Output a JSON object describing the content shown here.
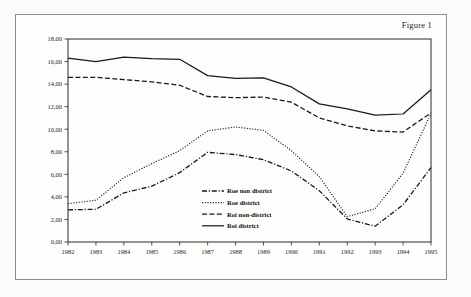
{
  "figure": {
    "caption": "Figure 1"
  },
  "chart_data": {
    "type": "line",
    "title": "Figure 1",
    "xlabel": "",
    "ylabel": "",
    "grid": false,
    "legend_position": "center",
    "xlim": [
      1982,
      1995
    ],
    "ylim": [
      0,
      18
    ],
    "ytick_step": 2,
    "x": [
      1982,
      1983,
      1984,
      1985,
      1986,
      1987,
      1988,
      1989,
      1990,
      1991,
      1992,
      1993,
      1994,
      1995
    ],
    "categories": [
      "1982",
      "1983",
      "1984",
      "1985",
      "1986",
      "1987",
      "1988",
      "1989",
      "1990",
      "1991",
      "1992",
      "1993",
      "1994",
      "1995"
    ],
    "ytick_labels": [
      "0,00",
      "2,00",
      "4,00",
      "6,00",
      "8,00",
      "10,00",
      "12,00",
      "14,00",
      "16,00",
      "18,00"
    ],
    "ytick_values": [
      0,
      2,
      4,
      6,
      8,
      10,
      12,
      14,
      16,
      18
    ],
    "series": [
      {
        "name": "Roe non district",
        "style": "dash-dot",
        "values": [
          2.85,
          2.9,
          4.35,
          4.95,
          6.15,
          7.95,
          7.75,
          7.3,
          6.3,
          4.55,
          2.05,
          1.4,
          3.3,
          6.6
        ]
      },
      {
        "name": "Roe district",
        "style": "dotted",
        "values": [
          3.4,
          3.7,
          5.7,
          6.95,
          8.1,
          9.85,
          10.2,
          9.9,
          8.1,
          5.8,
          2.25,
          2.95,
          6.1,
          11.4
        ]
      },
      {
        "name": "Roi non-district",
        "style": "dashed",
        "values": [
          14.6,
          14.6,
          14.4,
          14.2,
          13.9,
          12.9,
          12.8,
          12.85,
          12.4,
          11.0,
          10.3,
          9.85,
          9.75,
          11.45
        ]
      },
      {
        "name": "Roi district",
        "style": "solid",
        "values": [
          16.3,
          16.0,
          16.4,
          16.25,
          16.2,
          14.75,
          14.5,
          14.55,
          13.75,
          12.25,
          11.8,
          11.25,
          11.35,
          13.5
        ]
      }
    ]
  },
  "legend": {
    "items": [
      {
        "label": "Roe non district",
        "style": "dash-dot"
      },
      {
        "label": "Roe district",
        "style": "dotted"
      },
      {
        "label": "Roi non-district",
        "style": "dashed"
      },
      {
        "label": "Roi district",
        "style": "solid"
      }
    ]
  },
  "colors": {
    "line": "#1a1a1a",
    "frame": "#2a2a2a",
    "page": "#fbfbfa"
  }
}
